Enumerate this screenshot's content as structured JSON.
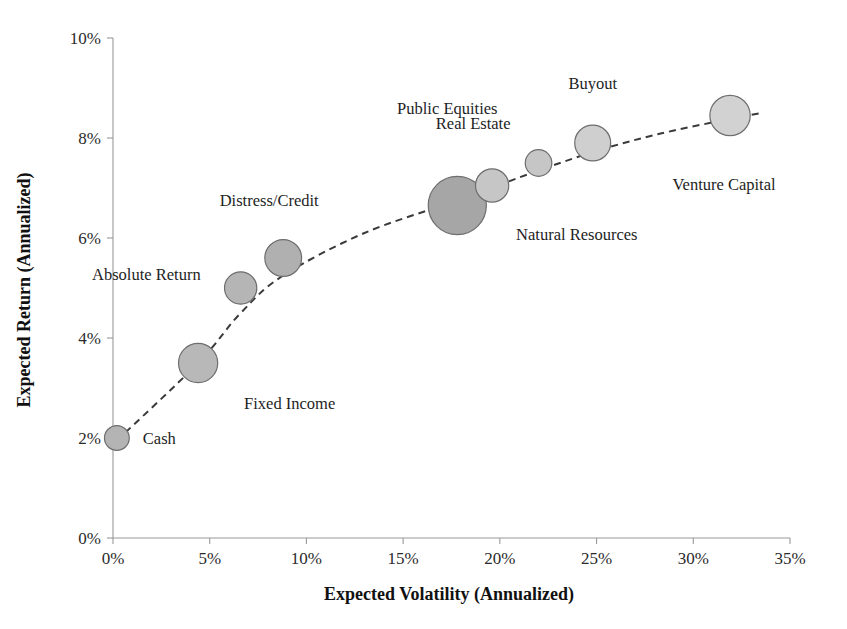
{
  "chart_data": {
    "type": "scatter",
    "title": "",
    "xlabel": "Expected Volatility (Annualized)",
    "ylabel": "Expected Return (Annualized)",
    "xlim": [
      0,
      35
    ],
    "ylim": [
      0,
      10
    ],
    "x_tick_labels": [
      "0%",
      "5%",
      "10%",
      "15%",
      "20%",
      "25%",
      "30%",
      "35%"
    ],
    "x_ticks": [
      0,
      5,
      10,
      15,
      20,
      25,
      30,
      35
    ],
    "y_tick_labels": [
      "0%",
      "2%",
      "4%",
      "6%",
      "8%",
      "10%"
    ],
    "y_ticks": [
      0,
      2,
      4,
      6,
      8,
      10
    ],
    "grid": false,
    "legend": "none",
    "annotations": [
      "dashed trend curve through asset classes"
    ],
    "points": [
      {
        "label": "Cash",
        "x": 0.2,
        "y": 2.0,
        "size": 2.0,
        "color": "#b4b4b4",
        "label_dx": 26,
        "label_dy": 6,
        "label_anchor": "start"
      },
      {
        "label": "Fixed Income",
        "x": 4.4,
        "y": 3.5,
        "size": 5.0,
        "color": "#b8b8b8",
        "label_dx": 46,
        "label_dy": 46,
        "label_anchor": "start"
      },
      {
        "label": "Absolute Return",
        "x": 6.6,
        "y": 5.0,
        "size": 3.4,
        "color": "#b5b5b5",
        "label_dx": -40,
        "label_dy": -8,
        "label_anchor": "end"
      },
      {
        "label": "Distress/Credit",
        "x": 8.8,
        "y": 5.6,
        "size": 4.4,
        "color": "#b0b0b0",
        "label_dx": -14,
        "label_dy": -52,
        "label_anchor": "middle"
      },
      {
        "label": "Public Equities",
        "x": 17.8,
        "y": 6.65,
        "size": 11.0,
        "color": "#a6a6a6",
        "label_dx": -10,
        "label_dy": -92,
        "label_anchor": "middle"
      },
      {
        "label": "Natural Resources",
        "x": 19.6,
        "y": 7.05,
        "size": 3.6,
        "color": "#c6c6c6",
        "label_dx": 24,
        "label_dy": 54,
        "label_anchor": "start"
      },
      {
        "label": "Real Estate",
        "x": 22.0,
        "y": 7.5,
        "size": 2.3,
        "color": "#c6c6c6",
        "label_dx": -28,
        "label_dy": -34,
        "label_anchor": "end"
      },
      {
        "label": "Buyout",
        "x": 24.8,
        "y": 7.9,
        "size": 4.2,
        "color": "#cfcfcf",
        "label_dx": 0,
        "label_dy": -54,
        "label_anchor": "middle"
      },
      {
        "label": "Venture Capital",
        "x": 31.9,
        "y": 8.45,
        "size": 5.3,
        "color": "#d2d2d2",
        "label_dx": -6,
        "label_dy": 74,
        "label_anchor": "middle"
      }
    ],
    "trend_points": [
      {
        "x": 0.2,
        "y": 1.95
      },
      {
        "x": 4.4,
        "y": 3.5
      },
      {
        "x": 6.6,
        "y": 4.5
      },
      {
        "x": 8.8,
        "y": 5.25
      },
      {
        "x": 13.0,
        "y": 6.1
      },
      {
        "x": 17.8,
        "y": 6.75
      },
      {
        "x": 22.0,
        "y": 7.35
      },
      {
        "x": 25.5,
        "y": 7.8
      },
      {
        "x": 29.0,
        "y": 8.15
      },
      {
        "x": 33.5,
        "y": 8.5
      }
    ]
  },
  "accents": {
    "axis_color": "#9a9a9a",
    "trend_color": "#3a3a3a",
    "text_color": "#1e1e1e"
  }
}
